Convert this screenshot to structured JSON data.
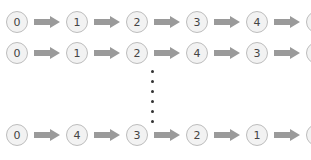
{
  "diagram": {
    "type": "permutation-sequences",
    "rows": [
      {
        "nodes": [
          "0",
          "1",
          "2",
          "3",
          "4",
          "0"
        ]
      },
      {
        "nodes": [
          "0",
          "1",
          "2",
          "4",
          "3",
          "0"
        ]
      },
      {
        "nodes": [
          "0",
          "4",
          "3",
          "2",
          "1",
          "0"
        ]
      }
    ],
    "ellipsis": "vertical-dots",
    "colors": {
      "node_fill": "#f2f2f2",
      "node_border": "#bdbdbd",
      "arrow": "#9a9a9a",
      "text": "#444444",
      "dots": "#333333"
    }
  }
}
